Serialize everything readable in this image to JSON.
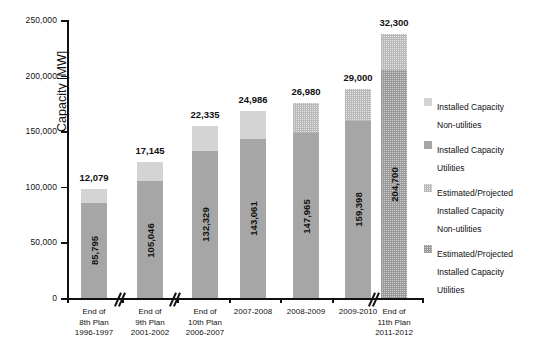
{
  "chart_data": {
    "type": "bar",
    "subtype": "stacked-bar",
    "title": "",
    "xlabel": "",
    "ylabel": "Capacity [MW]",
    "ylim": [
      0,
      250000
    ],
    "ytick_values": [
      0,
      50000,
      100000,
      150000,
      200000,
      250000
    ],
    "ytick_labels": [
      "0",
      "50,000",
      "100,000",
      "150,000",
      "200,000",
      "250,000"
    ],
    "grid": false,
    "legend_position": "right",
    "axis_breaks": true,
    "categories": [
      "End of\n8th Plan\n1996-1997",
      "End of\n9th Plan\n2001-2002",
      "End of\n10th Plan\n2006-2007",
      "2007-2008",
      "2008-2009",
      "2009-2010",
      "End of\n11th Plan\n2011-2012"
    ],
    "series": [
      {
        "name": "Installed Capacity Utilities",
        "values": [
          85795,
          105046,
          132329,
          143061,
          147965,
          159398,
          204700
        ],
        "labels": [
          "85,795",
          "105,046",
          "132,329",
          "143,061",
          "147,965",
          "159,398",
          "204,700"
        ],
        "projected": [
          false,
          false,
          false,
          false,
          false,
          false,
          true
        ],
        "color": "#a6a6a6"
      },
      {
        "name": "Installed Capacity Non-utilities",
        "values": [
          12079,
          17145,
          22335,
          24986,
          26980,
          29000,
          32300
        ],
        "labels": [
          "12,079",
          "17,145",
          "22,335",
          "24,986",
          "26,980",
          "29,000",
          "32,300"
        ],
        "projected": [
          false,
          false,
          false,
          false,
          true,
          true,
          true
        ],
        "color": "#d4d4d4"
      }
    ],
    "totals": [
      97874,
      122191,
      154664,
      168047,
      174945,
      188398,
      237000
    ]
  },
  "axis": {
    "y_title": "Capacity [MW]",
    "ticks": [
      {
        "label": "250,000"
      },
      {
        "label": "200,000"
      },
      {
        "label": "150,000"
      },
      {
        "label": "100,000"
      },
      {
        "label": "50,000"
      },
      {
        "label": "0"
      }
    ]
  },
  "categories": [
    {
      "line1": "End of",
      "line2": "8th Plan",
      "line3": "1996-1997"
    },
    {
      "line1": "End of",
      "line2": "9th Plan",
      "line3": "2001-2002"
    },
    {
      "line1": "End of",
      "line2": "10th Plan",
      "line3": "2006-2007"
    },
    {
      "line1": "2007-2008",
      "line2": "",
      "line3": ""
    },
    {
      "line1": "2008-2009",
      "line2": "",
      "line3": ""
    },
    {
      "line1": "2009-2010",
      "line2": "",
      "line3": ""
    },
    {
      "line1": "End of",
      "line2": "11th Plan",
      "line3": "2011-2012"
    }
  ],
  "bars": [
    {
      "top_label": "12,079",
      "inner_label": "85,795"
    },
    {
      "top_label": "17,145",
      "inner_label": "105,046"
    },
    {
      "top_label": "22,335",
      "inner_label": "132,329"
    },
    {
      "top_label": "24,986",
      "inner_label": "143,061"
    },
    {
      "top_label": "26,980",
      "inner_label": "147,965"
    },
    {
      "top_label": "29,000",
      "inner_label": "159,398"
    },
    {
      "top_label": "32,300",
      "inner_label": "204,700"
    }
  ],
  "legend": {
    "items": [
      {
        "label": "Installed Capacity\nNon-utilities",
        "swatch": "s1"
      },
      {
        "label": "Installed Capacity\nUtilities",
        "swatch": "s2"
      },
      {
        "label": "Estimated/Projected\nInstalled Capacity\nNon-utilities",
        "swatch": "s3"
      },
      {
        "label": "Estimated/Projected\nInstalled Capacity\nUtilities",
        "swatch": "s4"
      }
    ]
  },
  "colors": {
    "utilities": "#a6a6a6",
    "non_utilities": "#d4d4d4",
    "axis": "#111111"
  }
}
